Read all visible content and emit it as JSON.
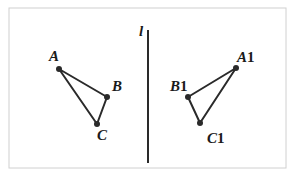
{
  "diagram": {
    "type": "reflection",
    "axis": {
      "label": "l",
      "x": 148,
      "y1": 30,
      "y2": 163
    },
    "frame": {
      "x": 9,
      "y": 8,
      "w": 277,
      "h": 160,
      "color": "#d0d0d0"
    },
    "colors": {
      "stroke": "#2a2a2a",
      "text": "#1a1a1a"
    },
    "original": {
      "points": [
        {
          "name": "A",
          "label": "A",
          "x": 59,
          "y": 69,
          "lx": 49,
          "ly": 61
        },
        {
          "name": "B",
          "label": "B",
          "x": 107,
          "y": 97,
          "lx": 112,
          "ly": 91
        },
        {
          "name": "C",
          "label": "C",
          "x": 97,
          "y": 124,
          "lx": 97,
          "ly": 140
        }
      ]
    },
    "image": {
      "points": [
        {
          "name": "A1",
          "label": "A",
          "sub": "1",
          "x": 236,
          "y": 68,
          "lx": 237,
          "ly": 62
        },
        {
          "name": "B1",
          "label": "B",
          "sub": "1",
          "x": 188,
          "y": 97,
          "lx": 170,
          "ly": 91
        },
        {
          "name": "C1",
          "label": "C",
          "sub": "1",
          "x": 200,
          "y": 123,
          "lx": 207,
          "ly": 143
        }
      ]
    }
  }
}
